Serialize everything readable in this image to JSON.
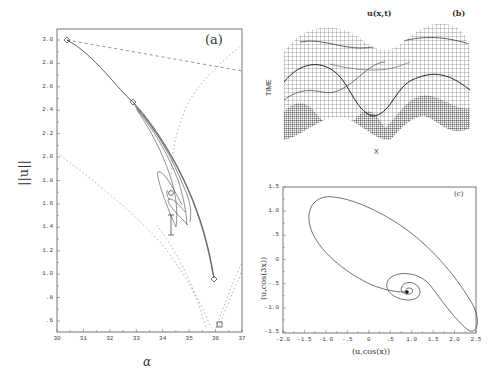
{
  "chart_data": [
    {
      "panel": "(a)",
      "type": "line",
      "title": "",
      "xlabel": "α",
      "ylabel": "||u||",
      "xlim": [
        30,
        37
      ],
      "ylim": [
        0.6,
        3.0
      ],
      "x_ticks": [
        "30",
        "31",
        "32",
        "33",
        "34",
        "35",
        "36",
        "37"
      ],
      "y_ticks": [
        "3.0",
        "2.8",
        "2.6",
        "2.4",
        "2.2",
        "2.0",
        "1.8",
        "1.6",
        "1.4",
        "1.2",
        "1.0",
        ".8",
        ".6"
      ],
      "grid": false,
      "series": [
        {
          "name": "solution branch (solid)",
          "style": "solid",
          "x": [
            30.4,
            31.0,
            31.6,
            32.2,
            33.0,
            33.6,
            34.2,
            34.8,
            35.3,
            35.7,
            36.05
          ],
          "y": [
            2.96,
            2.88,
            2.78,
            2.66,
            2.44,
            2.26,
            2.06,
            1.82,
            1.56,
            1.28,
            0.96
          ]
        },
        {
          "name": "upper dashed line",
          "style": "dashed",
          "x": [
            30.4,
            37.0
          ],
          "y": [
            2.96,
            2.7
          ]
        },
        {
          "name": "lower-left dashed curve",
          "style": "dotted",
          "x": [
            30.0,
            31.5,
            33.0,
            34.5,
            35.5,
            36.2
          ],
          "y": [
            2.06,
            1.82,
            1.56,
            1.28,
            1.0,
            0.68
          ]
        },
        {
          "name": "right dotted curve",
          "style": "dotted",
          "x": [
            37.0,
            35.8,
            34.8,
            34.3,
            34.2
          ],
          "y": [
            2.84,
            2.62,
            2.3,
            2.0,
            1.5
          ]
        },
        {
          "name": "cusp right branch",
          "style": "dotted",
          "x": [
            36.2,
            36.6,
            37.0
          ],
          "y": [
            0.68,
            0.92,
            1.2
          ]
        }
      ],
      "markers": [
        {
          "symbol": "diamond",
          "x": 30.4,
          "y": 2.96
        },
        {
          "symbol": "diamond",
          "x": 32.9,
          "y": 2.46
        },
        {
          "symbol": "circle",
          "x": 34.2,
          "y": 1.76
        },
        {
          "symbol": "diamond",
          "x": 36.05,
          "y": 0.96
        },
        {
          "symbol": "square",
          "x": 36.2,
          "y": 0.68
        },
        {
          "symbol": "cross",
          "x": 34.3,
          "y": 1.6
        },
        {
          "symbol": "cross",
          "x": 34.3,
          "y": 1.34
        }
      ],
      "annotation": "(a)"
    },
    {
      "panel": "(b)",
      "type": "surface",
      "title": "u(x,t)",
      "xlabel": "X",
      "ylabel": "TIME",
      "description": "3D wireframe mesh of u(x,t) showing a spatially periodic pattern with two peaks evolving in time",
      "annotation": "(b)"
    },
    {
      "panel": "(c)",
      "type": "line",
      "title": "",
      "xlabel": "(u,cos(x))",
      "ylabel": "(u,cos(3x))",
      "xlim": [
        -2.0,
        2.5
      ],
      "ylim": [
        -1.5,
        1.5
      ],
      "x_ticks": [
        "-2.0",
        "-1.5",
        "-1.0",
        "-.5",
        "0",
        ".5",
        "1.0",
        "1.5",
        "2.0",
        "2.5"
      ],
      "y_ticks": [
        "1.5",
        "1.0",
        ".5",
        "0",
        "-.5",
        "-1.0",
        "-1.5"
      ],
      "grid": false,
      "series": [
        {
          "name": "phase trajectory",
          "style": "solid",
          "x": [
            0.9,
            1.0,
            0.8,
            0.5,
            0.3,
            0.5,
            1.2,
            2.0,
            2.4,
            2.0,
            1.0,
            -0.5,
            -1.3,
            -1.5,
            -1.0,
            -0.2,
            0.9
          ],
          "y": [
            -0.72,
            -0.68,
            -0.8,
            -0.62,
            -0.75,
            -0.95,
            -1.25,
            -1.45,
            -1.25,
            -0.5,
            0.35,
            1.15,
            1.25,
            0.85,
            0.1,
            -0.72,
            -0.72
          ]
        }
      ],
      "markers": [
        {
          "symbol": "dot",
          "x": 0.95,
          "y": -0.72
        }
      ],
      "annotation": "(c)"
    }
  ],
  "labels": {
    "a": {
      "tag": "(a)",
      "xlabel": "α",
      "ylabel": "||u||"
    },
    "b": {
      "title": "u(x,t)",
      "tag": "(b)",
      "xlabel": "X",
      "ylabel": "TIME"
    },
    "c": {
      "tag": "(c)",
      "xlabel": "(u,cos(x))",
      "ylabel": "(u,cos(3x))"
    }
  }
}
